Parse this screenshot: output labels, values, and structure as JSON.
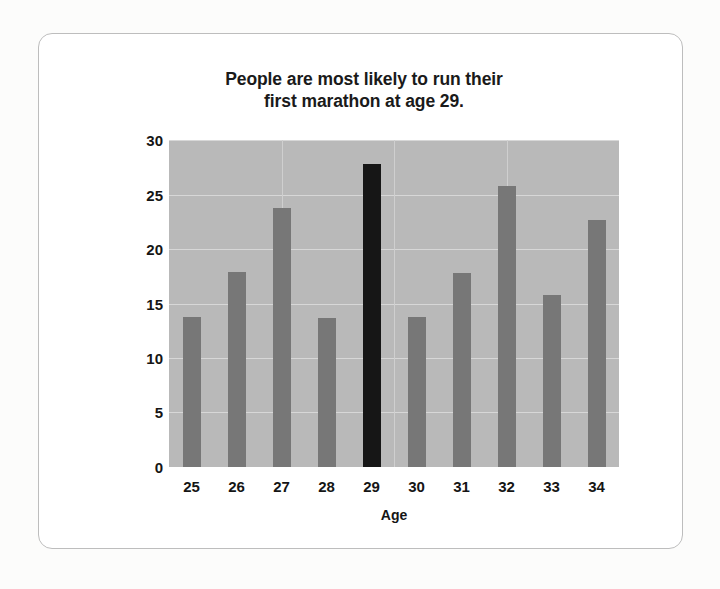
{
  "chart_data": {
    "type": "bar",
    "title": "People are most likely to run their first marathon at age 29.",
    "title_lines": [
      "People are most likely to run their",
      "first marathon at age 29."
    ],
    "xlabel": "Age",
    "ylabel": "Number of first-time marathoners per 500 runners",
    "ylabel_lines": [
      "Number of first-time marathoners",
      "per 500 runners"
    ],
    "categories": [
      "25",
      "26",
      "27",
      "28",
      "29",
      "30",
      "31",
      "32",
      "33",
      "34"
    ],
    "values": [
      13.8,
      17.9,
      23.8,
      13.7,
      27.8,
      13.8,
      17.8,
      25.8,
      15.8,
      22.7
    ],
    "highlight_category": "29",
    "ylim": [
      0,
      30
    ],
    "yticks": [
      30,
      25,
      20,
      15,
      10,
      5,
      0
    ],
    "ytick_labels": [
      "30",
      "25",
      "20",
      "15",
      "10",
      "5",
      "0"
    ],
    "grid": "horizontal-and-vertical",
    "legend": "none",
    "colors": {
      "bar": "#777777",
      "bar_highlight": "#161616",
      "plot_background": "#b9b9b9",
      "gridline": "#d7d7d7",
      "card_background": "#ffffff",
      "card_border": "#bdbdbd",
      "page_background": "#fcfcfb",
      "text": "#151515"
    }
  }
}
